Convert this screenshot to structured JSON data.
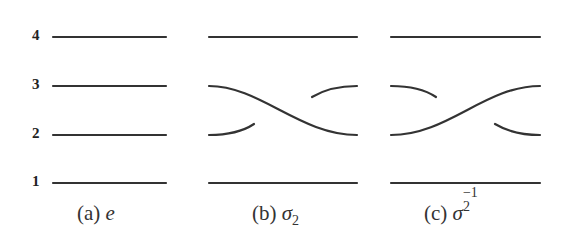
{
  "strand_labels": [
    "1",
    "2",
    "3",
    "4"
  ],
  "panels": [
    {
      "id": "a",
      "caption_prefix": "(a)",
      "caption_symbol": "e",
      "description": "identity braid: four parallel strands"
    },
    {
      "id": "b",
      "caption_prefix": "(b)",
      "caption_symbol": "σ",
      "caption_sub": "2",
      "description": "strand 3 passes over strand 2 (descending crosses over)"
    },
    {
      "id": "c",
      "caption_prefix": "(c)",
      "caption_symbol": "σ",
      "caption_sub": "2",
      "caption_sup": "−1",
      "description": "strand 2 passes over strand 3 (ascending crosses over)"
    }
  ],
  "colors": {
    "stroke": "#333333",
    "background": "#ffffff"
  }
}
